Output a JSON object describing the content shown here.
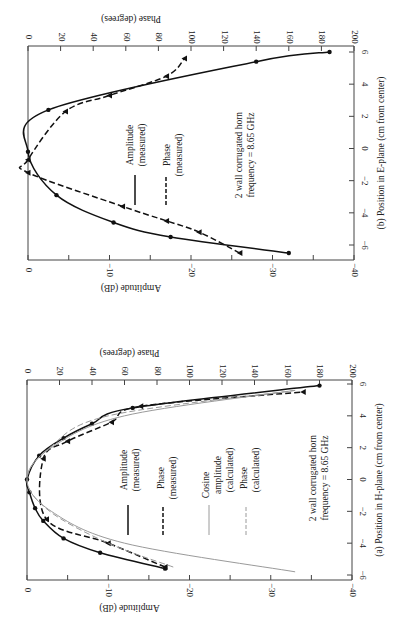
{
  "chart_data": [
    {
      "id": "b",
      "type": "line",
      "caption": "(b)  Position in E-plane (cm from center)",
      "xlabel": "Position in E-plane (cm from center)",
      "ylabel": "Amplitude (dB)",
      "y2label": "Phase (degrees)",
      "xlim": [
        -6,
        6
      ],
      "ylim": [
        -40,
        0
      ],
      "y2lim": [
        0,
        200
      ],
      "x_ticks": [
        -6,
        -4,
        -2,
        0,
        2,
        4,
        6
      ],
      "y_ticks": [
        0,
        -10,
        -20,
        -30,
        -40
      ],
      "y2_ticks": [
        0,
        20,
        40,
        60,
        80,
        100,
        120,
        140,
        160,
        180,
        200
      ],
      "annotation": [
        "2 wall corrugated horn",
        "frequency = 8.65 GHz"
      ],
      "legend": [
        "Amplitude (measured)",
        "Phase (measured)"
      ],
      "series": [
        {
          "name": "Amplitude (measured)",
          "style": "solid",
          "marker": "circle",
          "x": [
            -6.5,
            -5.5,
            -4.6,
            -2.9,
            -0.2,
            2.4,
            5.4,
            6.0
          ],
          "y": [
            -32.0,
            -17.5,
            -10.5,
            -3.5,
            0.0,
            -2.5,
            -28.0,
            -37.0
          ]
        },
        {
          "name": "Phase (measured)",
          "style": "dashed",
          "marker": "triangle",
          "x": [
            -6.5,
            -5.2,
            -4.5,
            -3.6,
            -1.5,
            -0.7,
            2.3,
            3.3,
            4.5,
            5.6
          ],
          "y": [
            130,
            105,
            85,
            58,
            0,
            0,
            23,
            50,
            85,
            96
          ]
        }
      ]
    },
    {
      "id": "a",
      "type": "line",
      "caption": "(a)  Position in H-plane (cm from center)",
      "xlabel": "Position in H-plane (cm from center)",
      "ylabel": "Amplitude (dB)",
      "y2label": "Phase (degrees)",
      "xlim": [
        -6,
        6
      ],
      "ylim": [
        -40,
        0
      ],
      "y2lim": [
        0,
        200
      ],
      "x_ticks": [
        -6,
        -4,
        -2,
        0,
        2,
        4,
        6
      ],
      "y_ticks": [
        0,
        -10,
        -20,
        -30,
        -40
      ],
      "y2_ticks": [
        0,
        20,
        40,
        60,
        80,
        100,
        120,
        140,
        160,
        180,
        200
      ],
      "annotation": [
        "2 wall corrugated horn",
        "frequency = 8.65 GHz"
      ],
      "legend": [
        "Amplitude (measured)",
        "Phase (measured)",
        "Cosine amplitude (calculated)",
        "Phase (calculated)"
      ],
      "series": [
        {
          "name": "Amplitude (measured)",
          "style": "solid",
          "marker": "circle",
          "x": [
            -5.6,
            -4.6,
            -3.7,
            -2.6,
            -1.8,
            -0.8,
            0.0,
            1.5,
            2.6,
            3.5,
            4.5,
            5.9
          ],
          "y": [
            -17.0,
            -9.0,
            -4.5,
            -2.0,
            -1.0,
            -0.3,
            0.0,
            -1.5,
            -4.5,
            -8.0,
            -13.0,
            -36.0
          ]
        },
        {
          "name": "Phase (measured)",
          "style": "dashed",
          "marker": "triangle",
          "x": [
            -5.5,
            -4.0,
            -2.5,
            1.3,
            2.4,
            3.6,
            4.6,
            5.5
          ],
          "y": [
            85,
            50,
            12,
            10,
            25,
            52,
            70,
            170
          ]
        },
        {
          "name": "Cosine amplitude (calculated)",
          "style": "solid-gray",
          "x": [
            -5.8,
            -4.0,
            -2.0,
            0.0,
            2.0,
            4.0,
            5.6
          ],
          "y": [
            -33.0,
            -12.0,
            -3.0,
            0.0,
            -3.0,
            -12.0,
            -33.0
          ]
        },
        {
          "name": "Phase (calculated)",
          "style": "dashed-gray",
          "x": [
            -5.5,
            -4.0,
            -2.0,
            0.0,
            2.0,
            4.0,
            5.6
          ],
          "y": [
            90,
            50,
            14,
            0,
            14,
            50,
            165
          ]
        }
      ]
    }
  ],
  "labels": {
    "b": {
      "phase_title": "Phase (degrees)",
      "amp_title": "Amplitude (dB)",
      "caption": "(b)  Position in E-plane (cm from center)",
      "legend_amp_1": "Amplitude",
      "legend_amp_2": "(measured)",
      "legend_phase_1": "Phase",
      "legend_phase_2": "(measured)",
      "note_1": "2 wall corrugated horn",
      "note_2": "frequency = 8.65 GHz"
    },
    "a": {
      "phase_title": "Phase (degrees)",
      "amp_title": "Amplitude (dB)",
      "caption": "(a)  Position in H-plane (cm from center)",
      "legend_amp_1": "Amplitude",
      "legend_amp_2": "(measured)",
      "legend_phase_1": "Phase",
      "legend_phase_2": "(measured)",
      "legend_cos_1": "Cosine",
      "legend_cos_2": "amplitude",
      "legend_cos_3": "(calculated)",
      "legend_pcalc_1": "Phase",
      "legend_pcalc_2": "(calculated)",
      "note_1": "2 wall corrugated horn",
      "note_2": "frequency = 8.65 GHz"
    }
  }
}
